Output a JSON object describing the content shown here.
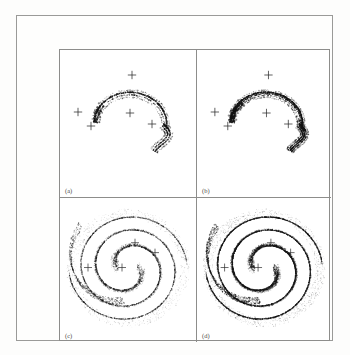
{
  "figure": {
    "background_color": "#ffffff",
    "frame_color": "#9a9a98",
    "ink_color": "#1a1a1a",
    "panel_count": 4
  },
  "panels": [
    {
      "id": "a",
      "label": "(a)",
      "description": "Sparse crescent (horseshoe) attractor with four cross markers",
      "density": "sparse",
      "marker_count": 5,
      "markers": [
        {
          "x": 72,
          "y": 25
        },
        {
          "x": 18,
          "y": 62
        },
        {
          "x": 31,
          "y": 76
        },
        {
          "x": 70,
          "y": 63
        },
        {
          "x": 92,
          "y": 74
        }
      ]
    },
    {
      "id": "b",
      "label": "(b)",
      "description": "Crescent attractor, slightly thickened filaments, four cross markers",
      "density": "medium-sparse",
      "marker_count": 5,
      "markers": [
        {
          "x": 72,
          "y": 25
        },
        {
          "x": 18,
          "y": 62
        },
        {
          "x": 31,
          "y": 76
        },
        {
          "x": 70,
          "y": 63
        },
        {
          "x": 92,
          "y": 74
        }
      ]
    },
    {
      "id": "c",
      "label": "(c)",
      "description": "Dense spiral (double-scroll) attractor with diffuse outer halo",
      "density": "dense-diffuse",
      "marker_count": 4,
      "markers": [
        {
          "x": 75,
          "y": 45
        },
        {
          "x": 28,
          "y": 70
        },
        {
          "x": 62,
          "y": 70
        },
        {
          "x": 95,
          "y": 55
        }
      ]
    },
    {
      "id": "d",
      "label": "(d)",
      "description": "Dense spiral attractor, darker and more filled than (c)",
      "density": "very-dense",
      "marker_count": 4,
      "markers": [
        {
          "x": 75,
          "y": 45
        },
        {
          "x": 28,
          "y": 70
        },
        {
          "x": 62,
          "y": 70
        },
        {
          "x": 95,
          "y": 55
        }
      ]
    }
  ],
  "chart_data": {
    "type": "scatter",
    "title": "",
    "subtitle": "",
    "xlabel": "",
    "ylabel": "",
    "grid": false,
    "legend": "none",
    "axis_ticks": "none",
    "subplots": [
      {
        "panel": "(a)",
        "type": "scatter",
        "shape": "crescent",
        "point_density_relative": 1,
        "filament_bands": 4,
        "marker_symbol": "plus",
        "markers_xy": [
          [
            72,
            25
          ],
          [
            18,
            62
          ],
          [
            31,
            76
          ],
          [
            70,
            63
          ],
          [
            92,
            74
          ]
        ]
      },
      {
        "panel": "(b)",
        "type": "scatter",
        "shape": "crescent",
        "point_density_relative": 2,
        "filament_bands": 5,
        "marker_symbol": "plus",
        "markers_xy": [
          [
            72,
            25
          ],
          [
            18,
            62
          ],
          [
            31,
            76
          ],
          [
            70,
            63
          ],
          [
            92,
            74
          ]
        ]
      },
      {
        "panel": "(c)",
        "type": "scatter",
        "shape": "spiral",
        "point_density_relative": 6,
        "filament_bands": 9,
        "marker_symbol": "plus",
        "markers_xy": [
          [
            75,
            45
          ],
          [
            28,
            70
          ],
          [
            62,
            70
          ],
          [
            95,
            55
          ]
        ]
      },
      {
        "panel": "(d)",
        "type": "scatter",
        "shape": "spiral",
        "point_density_relative": 10,
        "filament_bands": 11,
        "marker_symbol": "plus",
        "markers_xy": [
          [
            75,
            45
          ],
          [
            28,
            70
          ],
          [
            62,
            70
          ],
          [
            95,
            55
          ]
        ]
      }
    ]
  }
}
